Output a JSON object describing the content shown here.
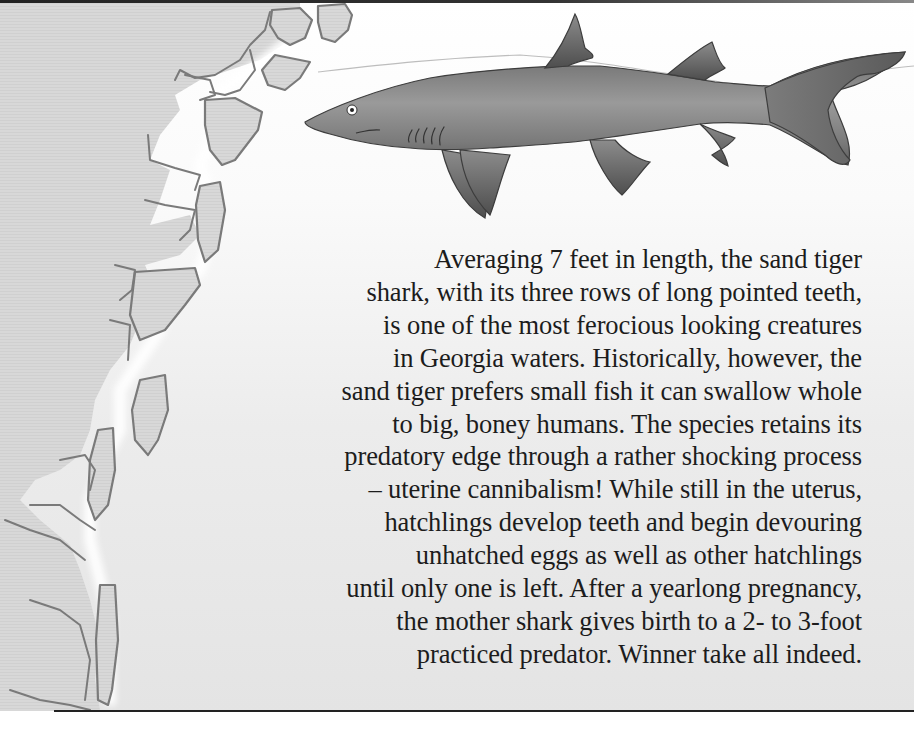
{
  "document": {
    "topic": "Sand tiger shark",
    "illustration": {
      "subject": "sand-tiger-shark",
      "map": "georgia-coastline-barrier-islands"
    },
    "caption_lines": [
      "Averaging 7 feet in length, the sand tiger",
      "shark, with its three rows of long pointed teeth,",
      "is one of the most ferocious looking creatures",
      "in Georgia waters. Historically, however, the",
      "sand tiger prefers small fish it can swallow whole",
      "to big, boney humans. The species retains its",
      "predatory edge through a rather shocking process",
      "– uterine cannibalism! While still in the uterus,",
      "hatchlings develop teeth and begin devouring",
      "unhatched eggs as well as other hatchlings",
      "until only one is left. After a yearlong pregnancy,",
      "the mother shark gives birth to a 2- to 3-foot",
      "practiced predator. Winner take all indeed."
    ]
  },
  "colors": {
    "land": "#d6d6d6",
    "coast_outline": "#7a7a7a",
    "water_glow": "#f4f4f4",
    "shark_body": "#8a8a8a",
    "shark_dark": "#5a5a5a",
    "text": "#1c1c1c",
    "rule": "#222222"
  }
}
